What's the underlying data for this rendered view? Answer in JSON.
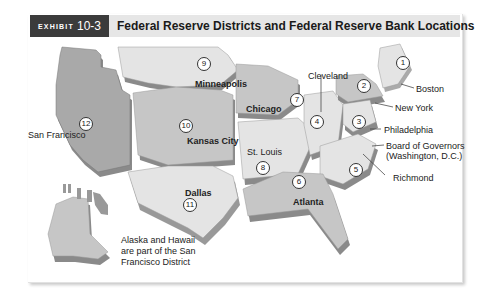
{
  "header": {
    "exhibit_label": "EXHIBIT",
    "exhibit_number": "10-3",
    "title": "Federal Reserve Districts and Federal Reserve Bank Locations"
  },
  "colors": {
    "exhibit_bg": "#3b3b3b",
    "header_bg": "#e6e6e6",
    "region_light": "#e4e4e4",
    "region_mid": "#c6c6c6",
    "region_dark": "#a9a9a9",
    "extrusion": "#8a8a8a"
  },
  "districts": [
    {
      "number": "1",
      "city": "Boston"
    },
    {
      "number": "2",
      "city": "New York"
    },
    {
      "number": "3",
      "city": "Philadelphia"
    },
    {
      "number": "4",
      "city": "Cleveland"
    },
    {
      "number": "5",
      "city": "Richmond"
    },
    {
      "number": "6",
      "city": "Atlanta"
    },
    {
      "number": "7",
      "city": "Chicago"
    },
    {
      "number": "8",
      "city": "St. Louis"
    },
    {
      "number": "9",
      "city": "Minneapolis"
    },
    {
      "number": "10",
      "city": "Kansas City"
    },
    {
      "number": "11",
      "city": "Dallas"
    },
    {
      "number": "12",
      "city": "San Francisco"
    }
  ],
  "board": {
    "line1": "Board of Governors",
    "line2": "(Washington, D.C.)"
  },
  "note": "Alaska and Hawaii are part of the San Francisco District"
}
